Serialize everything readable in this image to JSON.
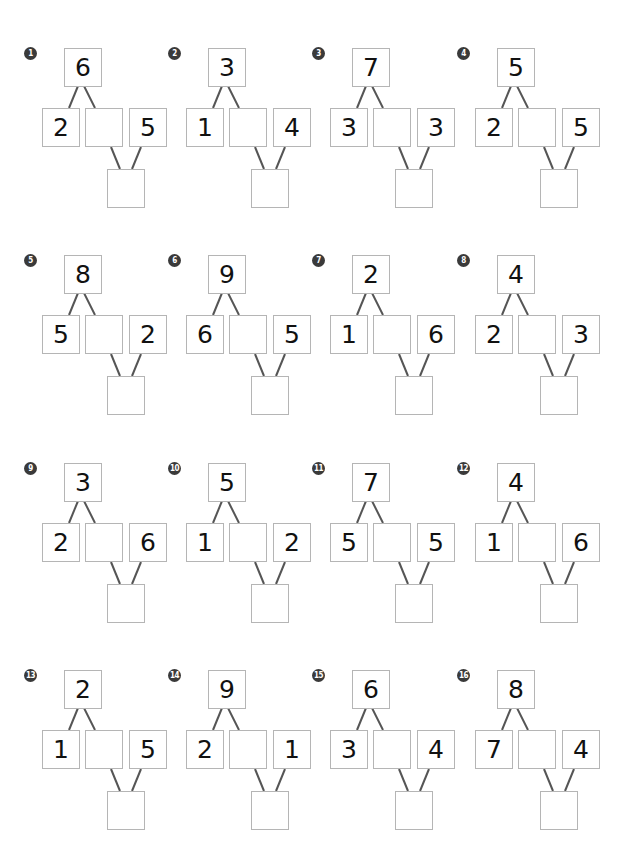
{
  "worksheet": {
    "problems": [
      {
        "number": "1",
        "top": "6",
        "left": "2",
        "middle": "",
        "right": "5",
        "bottom": ""
      },
      {
        "number": "2",
        "top": "3",
        "left": "1",
        "middle": "",
        "right": "4",
        "bottom": ""
      },
      {
        "number": "3",
        "top": "7",
        "left": "3",
        "middle": "",
        "right": "3",
        "bottom": ""
      },
      {
        "number": "4",
        "top": "5",
        "left": "2",
        "middle": "",
        "right": "5",
        "bottom": ""
      },
      {
        "number": "5",
        "top": "8",
        "left": "5",
        "middle": "",
        "right": "2",
        "bottom": ""
      },
      {
        "number": "6",
        "top": "9",
        "left": "6",
        "middle": "",
        "right": "5",
        "bottom": ""
      },
      {
        "number": "7",
        "top": "2",
        "left": "1",
        "middle": "",
        "right": "6",
        "bottom": ""
      },
      {
        "number": "8",
        "top": "4",
        "left": "2",
        "middle": "",
        "right": "3",
        "bottom": ""
      },
      {
        "number": "9",
        "top": "3",
        "left": "2",
        "middle": "",
        "right": "6",
        "bottom": ""
      },
      {
        "number": "10",
        "top": "5",
        "left": "1",
        "middle": "",
        "right": "2",
        "bottom": ""
      },
      {
        "number": "11",
        "top": "7",
        "left": "5",
        "middle": "",
        "right": "5",
        "bottom": ""
      },
      {
        "number": "12",
        "top": "4",
        "left": "1",
        "middle": "",
        "right": "6",
        "bottom": ""
      },
      {
        "number": "13",
        "top": "2",
        "left": "1",
        "middle": "",
        "right": "5",
        "bottom": ""
      },
      {
        "number": "14",
        "top": "9",
        "left": "2",
        "middle": "",
        "right": "1",
        "bottom": ""
      },
      {
        "number": "15",
        "top": "6",
        "left": "3",
        "middle": "",
        "right": "4",
        "bottom": ""
      },
      {
        "number": "16",
        "top": "8",
        "left": "7",
        "middle": "",
        "right": "4",
        "bottom": ""
      }
    ],
    "colors": {
      "box_border": "#b5b5b5",
      "line": "#555555",
      "badge": "#3a3a3a",
      "text": "#111111"
    }
  }
}
